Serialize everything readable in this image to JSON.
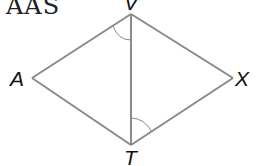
{
  "diagram": {
    "title": "AAS",
    "vertices": {
      "V": "V",
      "A": "A",
      "X": "X",
      "T": "T"
    },
    "segments": [
      "VA",
      "AT",
      "VX",
      "XT",
      "VT"
    ],
    "angle_marks": [
      "angle AVT",
      "angle XTV"
    ],
    "colors": {
      "line": "#8a8a8a",
      "label": "#111111"
    }
  }
}
